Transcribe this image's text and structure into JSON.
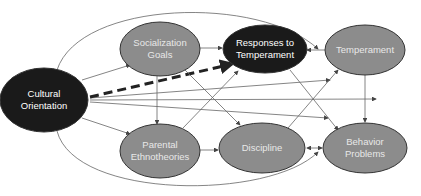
{
  "diagram": {
    "type": "path-model",
    "colors": {
      "dark_node": "#1a1a1a",
      "light_node": "#8c8c8c",
      "node_stroke": "#333333",
      "edge": "#555555",
      "highlight_edge": "#222222"
    },
    "nodes": [
      {
        "id": "cultural",
        "label": "Cultural\nOrientation",
        "style": "dark"
      },
      {
        "id": "socialization",
        "label": "Socialization\nGoals",
        "style": "light"
      },
      {
        "id": "responses",
        "label": "Responses to\nTemperament",
        "style": "dark"
      },
      {
        "id": "temperament",
        "label": "Temperament",
        "style": "light"
      },
      {
        "id": "parental",
        "label": "Parental\nEthnotheories",
        "style": "light"
      },
      {
        "id": "discipline",
        "label": "Discipline",
        "style": "light"
      },
      {
        "id": "behavior",
        "label": "Behavior\nProblems",
        "style": "light"
      }
    ],
    "edges": [
      {
        "from": "cultural",
        "to": "socialization"
      },
      {
        "from": "cultural",
        "to": "parental"
      },
      {
        "from": "cultural",
        "to": "responses",
        "style": "dashed-bold"
      },
      {
        "from": "cultural",
        "to": "temperament"
      },
      {
        "from": "cultural",
        "to": "discipline"
      },
      {
        "from": "cultural",
        "to": "behavior"
      },
      {
        "from": "cultural",
        "to": "temperament",
        "style": "curved-top"
      },
      {
        "from": "cultural",
        "to": "behavior",
        "style": "curved-bottom"
      },
      {
        "from": "socialization",
        "to": "responses"
      },
      {
        "from": "socialization",
        "to": "parental"
      },
      {
        "from": "socialization",
        "to": "behavior"
      },
      {
        "from": "parental",
        "to": "responses"
      },
      {
        "from": "parental",
        "to": "discipline"
      },
      {
        "from": "temperament",
        "to": "responses"
      },
      {
        "from": "temperament",
        "to": "discipline"
      },
      {
        "from": "temperament",
        "to": "behavior"
      },
      {
        "from": "responses",
        "to": "behavior"
      },
      {
        "from": "discipline",
        "to": "behavior",
        "style": "bidirectional"
      }
    ]
  }
}
